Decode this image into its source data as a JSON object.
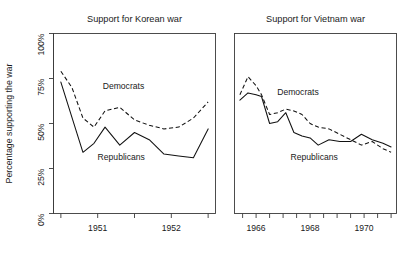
{
  "figure": {
    "ylabel": "Percentage supporting the war",
    "y_ticks": [
      "0%",
      "25%",
      "50%",
      "75%",
      "100%"
    ],
    "series_names": {
      "democrats": "Democrats",
      "republicans": "Republicans"
    }
  },
  "chart_data": [
    {
      "type": "line",
      "title": "Support for Korean war",
      "xlabel": "",
      "ylabel": "Percentage supporting the war",
      "ylim": [
        0,
        100
      ],
      "yticks": [
        0,
        25,
        50,
        75,
        100
      ],
      "ytick_labels": [
        "0%",
        "25%",
        "50%",
        "75%",
        "100%"
      ],
      "xlim": [
        1950.4,
        1952.6
      ],
      "xticks": [
        1951,
        1952
      ],
      "xtick_labels": [
        "1951",
        "1952"
      ],
      "grid": false,
      "legend": "inline-labels",
      "series": [
        {
          "name": "Democrats",
          "style": "dashed",
          "x": [
            1950.5,
            1950.65,
            1950.8,
            1950.95,
            1951.1,
            1951.3,
            1951.5,
            1951.7,
            1951.9,
            1952.1,
            1952.3,
            1952.5
          ],
          "values": [
            79,
            70,
            53,
            48,
            57,
            59,
            52,
            49,
            47,
            48,
            53,
            62
          ]
        },
        {
          "name": "Republicans",
          "style": "solid",
          "x": [
            1950.5,
            1950.8,
            1950.95,
            1951.1,
            1951.3,
            1951.5,
            1951.7,
            1951.9,
            1952.1,
            1952.3,
            1952.5
          ],
          "values": [
            73,
            34,
            39,
            48,
            38,
            45,
            41,
            33,
            32,
            31,
            47
          ]
        }
      ]
    },
    {
      "type": "line",
      "title": "Support for Vietnam war",
      "xlabel": "",
      "ylabel": "Percentage supporting the war",
      "ylim": [
        0,
        100
      ],
      "yticks": [
        0,
        25,
        50,
        75,
        100
      ],
      "ytick_labels": [
        "0%",
        "25%",
        "50%",
        "75%",
        "100%"
      ],
      "xlim": [
        1965.2,
        1971.2
      ],
      "xticks": [
        1966,
        1968,
        1970
      ],
      "xtick_labels": [
        "1966",
        "1968",
        "1970"
      ],
      "grid": false,
      "legend": "inline-labels",
      "series": [
        {
          "name": "Democrats",
          "style": "dashed",
          "x": [
            1965.4,
            1965.7,
            1966.0,
            1966.2,
            1966.5,
            1966.8,
            1967.1,
            1967.4,
            1967.7,
            1968.0,
            1968.3,
            1968.7,
            1969.1,
            1969.5,
            1969.9,
            1970.3,
            1970.7,
            1971.0
          ],
          "values": [
            66,
            76,
            71,
            66,
            55,
            56,
            58,
            57,
            55,
            50,
            48,
            47,
            44,
            41,
            38,
            40,
            36,
            34
          ]
        },
        {
          "name": "Republicans",
          "style": "solid",
          "x": [
            1965.4,
            1965.7,
            1966.0,
            1966.2,
            1966.5,
            1966.8,
            1967.1,
            1967.4,
            1967.7,
            1968.0,
            1968.3,
            1968.7,
            1969.1,
            1969.5,
            1969.9,
            1970.3,
            1970.7,
            1971.0
          ],
          "values": [
            63,
            67,
            66,
            65,
            50,
            51,
            56,
            45,
            43,
            42,
            38,
            41,
            40,
            40,
            44,
            41,
            39,
            37
          ]
        }
      ]
    }
  ],
  "annotations": {
    "korean": {
      "democrats": {
        "text": "Democrats",
        "x": 1951.35,
        "y": 69
      },
      "republicans": {
        "text": "Republicans",
        "x": 1951.32,
        "y": 30
      }
    },
    "vietnam": {
      "democrats": {
        "text": "Democrats",
        "x": 1967.55,
        "y": 66
      },
      "republicans": {
        "text": "Republicans",
        "x": 1968.15,
        "y": 30
      }
    }
  }
}
